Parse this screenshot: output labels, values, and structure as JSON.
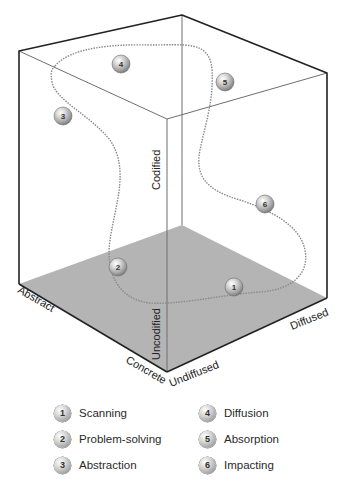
{
  "diagram": {
    "type": "3d-cube-information-space",
    "axes": {
      "vertical": {
        "top_label": "Codified",
        "bottom_label": "Uncodified"
      },
      "left_depth": {
        "far_label": "Abstract",
        "near_label": "Concrete"
      },
      "right_depth": {
        "near_label": "Undiffused",
        "far_label": "Diffused"
      }
    },
    "balls": [
      {
        "number": "1",
        "x": 234,
        "y": 287
      },
      {
        "number": "2",
        "x": 118,
        "y": 267
      },
      {
        "number": "3",
        "x": 63,
        "y": 116
      },
      {
        "number": "4",
        "x": 121,
        "y": 64
      },
      {
        "number": "5",
        "x": 225,
        "y": 82
      },
      {
        "number": "6",
        "x": 265,
        "y": 204
      }
    ],
    "colors": {
      "floor": "#b4b4b4",
      "edge_dark": "#222222",
      "edge_light": "#6e6e6e",
      "curve": "#8a8a8a"
    }
  },
  "legend": {
    "items": [
      {
        "number": "1",
        "label": "Scanning"
      },
      {
        "number": "2",
        "label": "Problem-solving"
      },
      {
        "number": "3",
        "label": "Abstraction"
      },
      {
        "number": "4",
        "label": "Diffusion"
      },
      {
        "number": "5",
        "label": "Absorption"
      },
      {
        "number": "6",
        "label": "Impacting"
      }
    ]
  }
}
